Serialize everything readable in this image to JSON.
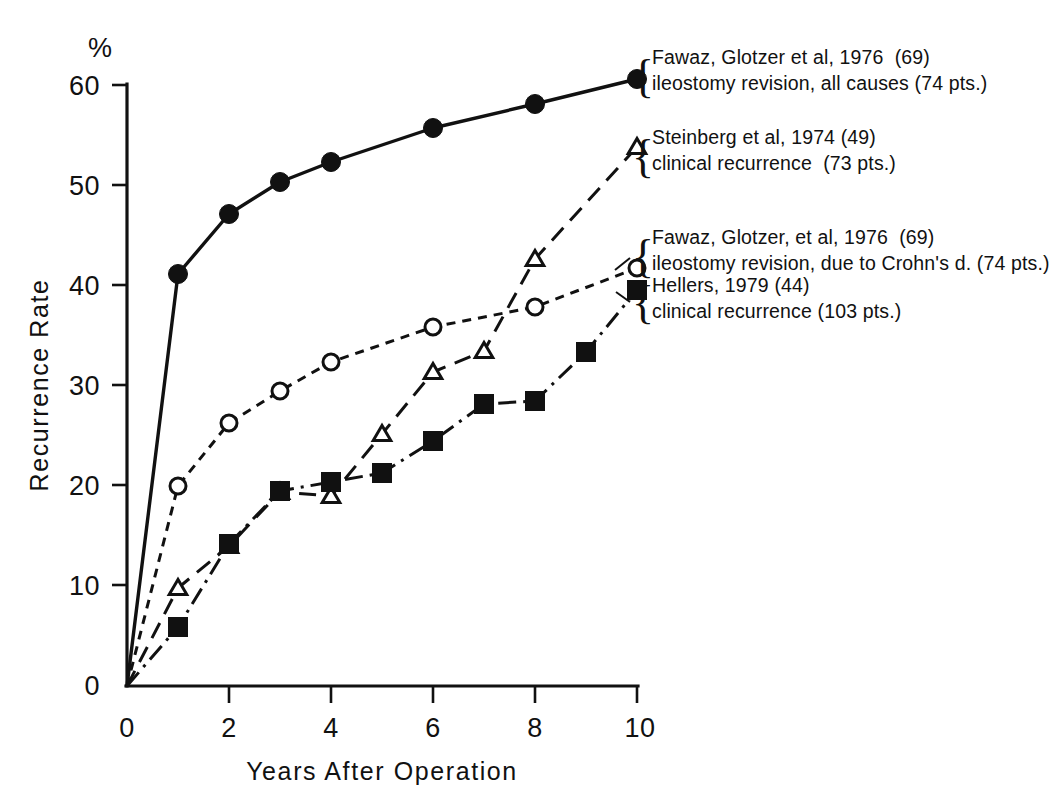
{
  "chart_data": {
    "type": "line",
    "title": "",
    "subtitle": "",
    "xlabel": "Years After Operation",
    "ylabel": "Recurrence Rate",
    "yunit": "%",
    "xlim": [
      0,
      10
    ],
    "ylim": [
      0,
      60
    ],
    "xticks": [
      0,
      2,
      4,
      6,
      8,
      10
    ],
    "xtick_labels": [
      "0",
      "2",
      "4",
      "6",
      "8",
      "10"
    ],
    "yticks": [
      0,
      10,
      20,
      30,
      40,
      50,
      60
    ],
    "ytick_labels": [
      "0",
      "10",
      "20",
      "30",
      "40",
      "50",
      "60"
    ],
    "grid": false,
    "legend_position": "right",
    "series": [
      {
        "name": "fawaz-all-causes",
        "marker": "filled-circle",
        "linestyle": "solid",
        "legend_line_1": "Fawaz, Glotzer et al, 1976  (69)",
        "legend_line_2": "ileostomy revision, all causes (74 pts.)",
        "x": [
          0,
          1,
          2,
          3,
          4,
          6,
          8,
          10
        ],
        "values": [
          0,
          41.2,
          47.2,
          50.4,
          52.4,
          55.8,
          58.2,
          60.7
        ]
      },
      {
        "name": "steinberg-clinical-recurrence",
        "marker": "open-triangle",
        "linestyle": "long-dash",
        "legend_line_1": "Steinberg et al, 1974 (49)",
        "legend_line_2": "clinical recurrence  (73 pts.)",
        "x": [
          0,
          1,
          2,
          3,
          4,
          5,
          6,
          7,
          8,
          10
        ],
        "values": [
          0,
          9.8,
          14.0,
          19.4,
          19.0,
          25.2,
          31.4,
          33.5,
          42.7,
          53.9
        ]
      },
      {
        "name": "fawaz-crohns-disease",
        "marker": "open-circle",
        "linestyle": "short-dash",
        "legend_line_1": "Fawaz, Glotzer, et al, 1976  (69)",
        "legend_line_2": "ileostomy revision, due to Crohn's d. (74 pts.)",
        "x": [
          0,
          1,
          2,
          3,
          4,
          6,
          8,
          10
        ],
        "values": [
          0,
          20.0,
          26.3,
          29.5,
          32.4,
          35.9,
          37.9,
          41.8
        ]
      },
      {
        "name": "hellers-clinical-recurrence",
        "marker": "filled-square",
        "linestyle": "dash-dot",
        "legend_line_1": "Hellers, 1979 (44)",
        "legend_line_2": "clinical recurrence (103 pts.)",
        "x": [
          0,
          1,
          2,
          3,
          4,
          5,
          6,
          7,
          8,
          9,
          10
        ],
        "values": [
          0,
          5.9,
          14.2,
          19.5,
          20.4,
          21.3,
          24.5,
          28.2,
          28.5,
          33.4,
          39.6
        ]
      }
    ]
  }
}
